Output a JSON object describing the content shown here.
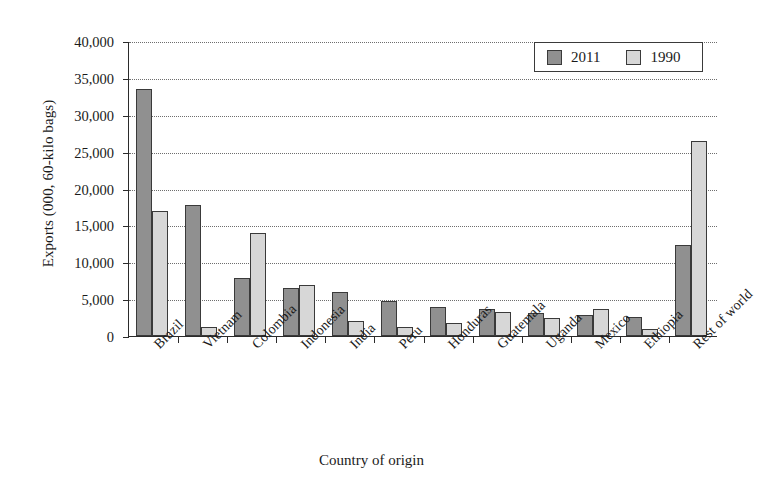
{
  "chart_data": {
    "type": "bar",
    "title": "",
    "xlabel": "Country of origin",
    "ylabel": "Exports (000, 60-kilo bags)",
    "categories": [
      "Brazil",
      "Vietnam",
      "Colombia",
      "Indonesia",
      "India",
      "Peru",
      "Honduras",
      "Guatemala",
      "Uganda",
      "Mexico",
      "Ethiopia",
      "Rest of world"
    ],
    "series": [
      {
        "name": "2011",
        "color": "#909090",
        "values": [
          33500,
          17700,
          7800,
          6500,
          6000,
          4700,
          4000,
          3700,
          3100,
          2900,
          2600,
          12400
        ]
      },
      {
        "name": "1990",
        "color": "#d7d7d7",
        "values": [
          17000,
          1200,
          14000,
          6900,
          2000,
          1200,
          1700,
          3200,
          2400,
          3700,
          1000,
          26500
        ]
      }
    ],
    "ylim": [
      0,
      40000
    ],
    "ytick_values": [
      0,
      5000,
      10000,
      15000,
      20000,
      25000,
      30000,
      35000,
      40000
    ],
    "ytick_labels": [
      "0",
      "5,000",
      "10,000",
      "15,000",
      "20,000",
      "25,000",
      "30,000",
      "35,000",
      "40,000"
    ],
    "grid": "horizontal-dotted",
    "legend_position": "top-right",
    "legend_entries": [
      "2011",
      "1990"
    ]
  }
}
